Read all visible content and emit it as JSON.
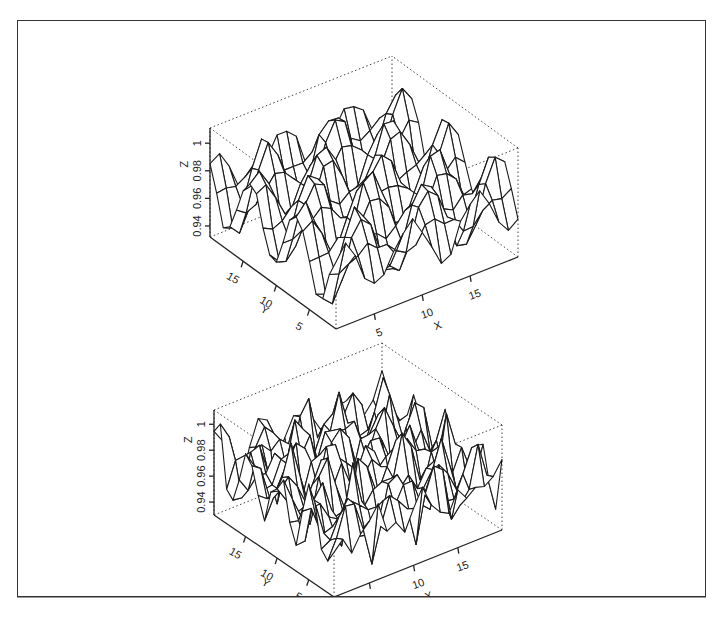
{
  "chart_data": [
    {
      "type": "surface-wireframe",
      "title": "",
      "xlabel": "X",
      "ylabel": "Y",
      "zlabel": "Z",
      "x_ticks": [
        "5",
        "10",
        "15"
      ],
      "y_ticks": [
        "5",
        "10",
        "15"
      ],
      "z_ticks": [
        "0.94",
        "0.96",
        "0.98",
        "1"
      ],
      "x_tick_values": [
        5,
        10,
        15
      ],
      "y_tick_values": [
        5,
        10,
        15
      ],
      "z_tick_values": [
        0.94,
        0.96,
        0.98,
        1.0
      ],
      "xlim": [
        1,
        20
      ],
      "ylim": [
        1,
        20
      ],
      "zlim": [
        0.932,
        1.011
      ],
      "grid_size": [
        20,
        20
      ],
      "surface": {
        "description": "smooth periodic ripple surface",
        "base": 0.97,
        "amplitude": 0.03,
        "freq": 0.9,
        "noise": 0.004,
        "seed": 7
      }
    },
    {
      "type": "surface-wireframe",
      "title": "",
      "xlabel": "X",
      "ylabel": "Y",
      "zlabel": "Z",
      "x_ticks": [
        "5",
        "10",
        "15"
      ],
      "y_ticks": [
        "5",
        "10",
        "15"
      ],
      "z_ticks": [
        "0.94",
        "0.96",
        "0.98",
        "1"
      ],
      "x_tick_values": [
        5,
        10,
        15
      ],
      "y_tick_values": [
        5,
        10,
        15
      ],
      "z_tick_values": [
        0.94,
        0.96,
        0.98,
        1.0
      ],
      "xlim": [
        1,
        20
      ],
      "ylim": [
        1,
        20
      ],
      "zlim": [
        0.93,
        1.011
      ],
      "grid_size": [
        20,
        20
      ],
      "surface": {
        "description": "noisier ripple surface",
        "base": 0.97,
        "amplitude": 0.025,
        "freq": 1.3,
        "noise": 0.012,
        "seed": 13
      }
    }
  ]
}
